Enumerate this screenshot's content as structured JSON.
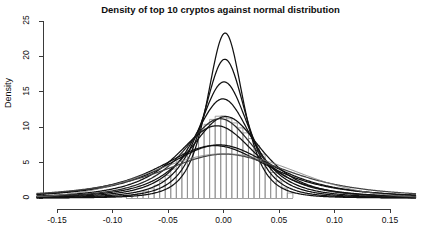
{
  "chart_data": {
    "type": "area",
    "title": "Density of top 10 cryptos against normal distribution",
    "xlabel": "",
    "ylabel": "Density",
    "xlim": [
      -0.168,
      0.173
    ],
    "ylim": [
      0,
      25
    ],
    "xticks": [
      -0.15,
      -0.1,
      -0.05,
      0.0,
      0.05,
      0.1,
      0.15
    ],
    "xtick_labels": [
      "-0.15",
      "-0.10",
      "-0.05",
      "0.00",
      "0.05",
      "0.10",
      "0.15"
    ],
    "yticks": [
      0,
      5,
      10,
      15,
      20,
      25
    ],
    "ytick_labels": [
      "0",
      "5",
      "10",
      "15",
      "20",
      "25"
    ],
    "grid": false,
    "legend": "none",
    "histogram": {
      "fill": "#ffffff",
      "stroke": "#8a8a8a",
      "bin_width": 0.005,
      "bins_start": -0.0875,
      "bin_centers": [
        -0.085,
        -0.08,
        -0.075,
        -0.07,
        -0.065,
        -0.06,
        -0.055,
        -0.05,
        -0.045,
        -0.04,
        -0.035,
        -0.03,
        -0.025,
        -0.02,
        -0.015,
        -0.01,
        -0.005,
        0.0,
        0.005,
        0.01,
        0.015,
        0.02,
        0.025,
        0.03,
        0.035,
        0.04,
        0.045,
        0.05,
        0.055,
        0.06
      ],
      "densities": [
        0.35,
        0.5,
        0.7,
        0.95,
        1.3,
        1.8,
        2.4,
        3.2,
        4.1,
        5.2,
        6.3,
        7.4,
        8.5,
        9.5,
        10.4,
        11.1,
        11.55,
        11.6,
        11.2,
        10.6,
        9.9,
        9.2,
        8.4,
        7.4,
        6.2,
        4.9,
        3.6,
        2.4,
        1.4,
        0.7
      ]
    },
    "series": [
      {
        "name": "curve-1",
        "color": "#111111",
        "peak": 23.3,
        "mean": 0.0015,
        "sd": 0.0171,
        "df": 3.2,
        "weight": 1.0
      },
      {
        "name": "curve-2",
        "color": "#111111",
        "peak": 19.6,
        "mean": 0.0012,
        "sd": 0.0203,
        "df": 3.0,
        "weight": 1.0
      },
      {
        "name": "curve-3",
        "color": "#111111",
        "peak": 16.4,
        "mean": 0.0005,
        "sd": 0.0243,
        "df": 2.8,
        "weight": 1.0
      },
      {
        "name": "curve-4",
        "color": "#111111",
        "peak": 14.0,
        "mean": -0.0005,
        "sd": 0.0285,
        "df": 2.6,
        "weight": 1.0
      },
      {
        "name": "curve-5",
        "color": "#111111",
        "peak": 11.5,
        "mean": 0.002,
        "sd": 0.0347,
        "df": 2.6,
        "weight": 1.0
      },
      {
        "name": "curve-6",
        "color": "#2a2a2a",
        "peak": 11.2,
        "mean": -0.003,
        "sd": 0.0356,
        "df": 2.5,
        "weight": 1.0
      },
      {
        "name": "curve-7",
        "color": "#111111",
        "peak": 10.2,
        "mean": -0.006,
        "sd": 0.0392,
        "df": 2.4,
        "weight": 1.0
      },
      {
        "name": "curve-8",
        "color": "#111111",
        "peak": 7.5,
        "mean": -0.004,
        "sd": 0.0533,
        "df": 2.4,
        "weight": 1.0
      },
      {
        "name": "curve-9",
        "color": "#111111",
        "peak": 7.4,
        "mean": -0.008,
        "sd": 0.054,
        "df": 2.3,
        "weight": 1.0
      },
      {
        "name": "curve-10",
        "color": "#444444",
        "peak": 6.2,
        "mean": 0.001,
        "sd": 0.0644,
        "df": 2.2,
        "weight": 1.0
      },
      {
        "name": "normal-reference",
        "color": "#7d7d7d",
        "peak": 6.25,
        "mean": 0.0005,
        "sd": 0.0638,
        "df": 0,
        "weight": 1.0
      }
    ]
  }
}
